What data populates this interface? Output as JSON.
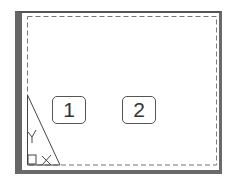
{
  "layout_view": {
    "viewports": [
      {
        "id": "1",
        "label": "1"
      },
      {
        "id": "2",
        "label": "2"
      }
    ],
    "ucs_icon": {
      "x_label": "X",
      "y_label": "Y"
    },
    "colors": {
      "frame": "#666666",
      "dashed_border": "#777777",
      "paper": "#ffffff"
    }
  }
}
